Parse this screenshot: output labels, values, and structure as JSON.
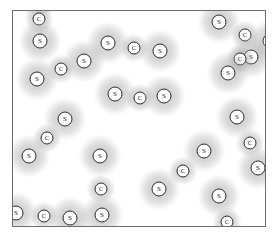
{
  "figure": {
    "substance": "CS2",
    "substance_name": "carbon disulfide",
    "frame": {
      "x": 12,
      "y": 10,
      "width": 254,
      "height": 217,
      "border_color": "#6e6e6e",
      "fill_color": "#ffffff"
    },
    "atom_types": {
      "S": {
        "label": "S",
        "name": "sulfur-atom",
        "halo_diameter": 44,
        "nucleus_diameter": 15
      },
      "C": {
        "label": "C",
        "name": "carbon-atom",
        "halo_diameter": 30,
        "nucleus_diameter": 13
      }
    },
    "halo_color": "#969696",
    "nucleus_outline_color": "#2b2b2b",
    "nucleus_fill_color": "#fdfdfd"
  },
  "molecules": [
    {
      "id": "molecule-1",
      "orientation": "vertical-clipped-top",
      "atoms": [
        {
          "type": "S",
          "label": "S",
          "x": 26,
          "y": -14
        },
        {
          "type": "C",
          "label": "C",
          "x": 26,
          "y": 8
        },
        {
          "type": "S",
          "label": "S",
          "x": 27,
          "y": 30
        }
      ]
    },
    {
      "id": "molecule-2",
      "orientation": "diagonal-down-left",
      "atoms": [
        {
          "type": "S",
          "label": "S",
          "x": 71,
          "y": 50
        },
        {
          "type": "C",
          "label": "C",
          "x": 48,
          "y": 58
        },
        {
          "type": "S",
          "label": "S",
          "x": 24,
          "y": 68
        }
      ]
    },
    {
      "id": "molecule-3",
      "orientation": "horizontal",
      "atoms": [
        {
          "type": "S",
          "label": "S",
          "x": 95,
          "y": 32
        },
        {
          "type": "C",
          "label": "C",
          "x": 121,
          "y": 37
        },
        {
          "type": "S",
          "label": "S",
          "x": 147,
          "y": 40
        }
      ]
    },
    {
      "id": "molecule-4",
      "orientation": "horizontal",
      "atoms": [
        {
          "type": "S",
          "label": "S",
          "x": 102,
          "y": 83
        },
        {
          "type": "C",
          "label": "C",
          "x": 127,
          "y": 87
        },
        {
          "type": "S",
          "label": "S",
          "x": 151,
          "y": 85
        }
      ]
    },
    {
      "id": "molecule-5",
      "orientation": "diagonal-down-left",
      "atoms": [
        {
          "type": "S",
          "label": "S",
          "x": 52,
          "y": 108
        },
        {
          "type": "C",
          "label": "C",
          "x": 34,
          "y": 127
        },
        {
          "type": "S",
          "label": "S",
          "x": 16,
          "y": 145
        }
      ]
    },
    {
      "id": "molecule-6",
      "orientation": "vertical",
      "atoms": [
        {
          "type": "S",
          "label": "S",
          "x": 87,
          "y": 145
        },
        {
          "type": "C",
          "label": "C",
          "x": 88,
          "y": 178
        },
        {
          "type": "S",
          "label": "S",
          "x": 89,
          "y": 204
        }
      ]
    },
    {
      "id": "molecule-7",
      "orientation": "diagonal-down-left",
      "atoms": [
        {
          "type": "S",
          "label": "S",
          "x": 191,
          "y": 140
        },
        {
          "type": "C",
          "label": "C",
          "x": 170,
          "y": 160
        },
        {
          "type": "S",
          "label": "S",
          "x": 146,
          "y": 178
        }
      ]
    },
    {
      "id": "molecule-8",
      "orientation": "horizontal-clipped-left",
      "atoms": [
        {
          "type": "S",
          "label": "S",
          "x": 3,
          "y": 202
        },
        {
          "type": "C",
          "label": "C",
          "x": 31,
          "y": 205
        },
        {
          "type": "S",
          "label": "S",
          "x": 57,
          "y": 207
        }
      ]
    },
    {
      "id": "molecule-9",
      "orientation": "diagonal-down-right-clipped",
      "atoms": [
        {
          "type": "S",
          "label": "S",
          "x": 206,
          "y": 11
        },
        {
          "type": "C",
          "label": "C",
          "x": 232,
          "y": 24
        },
        {
          "type": "S",
          "label": "S",
          "x": 257,
          "y": 30
        }
      ]
    },
    {
      "id": "molecule-10",
      "orientation": "diagonal-down-left",
      "atoms": [
        {
          "type": "S",
          "label": "S",
          "x": 238,
          "y": 46
        },
        {
          "type": "C",
          "label": "C",
          "x": 227,
          "y": 48
        },
        {
          "type": "S",
          "label": "S",
          "x": 215,
          "y": 62
        }
      ]
    },
    {
      "id": "molecule-11",
      "orientation": "diagonal-down-left",
      "atoms": [
        {
          "type": "S",
          "label": "S",
          "x": 224,
          "y": 106
        },
        {
          "type": "C",
          "label": "C",
          "x": 237,
          "y": 132
        },
        {
          "type": "S",
          "label": "S",
          "x": 245,
          "y": 157
        }
      ]
    },
    {
      "id": "molecule-12",
      "orientation": "diagonal-down-left-clipped-bottom",
      "atoms": [
        {
          "type": "S",
          "label": "S",
          "x": 206,
          "y": 185
        },
        {
          "type": "C",
          "label": "C",
          "x": 214,
          "y": 211
        },
        {
          "type": "S",
          "label": "S",
          "x": 222,
          "y": 236
        }
      ]
    }
  ]
}
